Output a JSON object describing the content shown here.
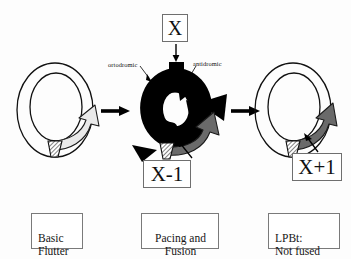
{
  "figure": {
    "type": "medical-mechanism-diagram",
    "background_color": "#fdfdfd"
  },
  "value_boxes": [
    {
      "id": "x",
      "label": "X",
      "meaning": "pacing stimulus cycle length"
    },
    {
      "id": "x-1",
      "label": "X-1",
      "meaning": "fused beat interval"
    },
    {
      "id": "x+1",
      "label": "X+1",
      "meaning": "last paced beat interval"
    }
  ],
  "captions": [
    {
      "id": "basic-flutter",
      "text": "Basic\nFlutter"
    },
    {
      "id": "pacing-fusion",
      "text": "Pacing and\nFusion"
    },
    {
      "id": "lpbt-not-fused",
      "text": "LPBt:\nNot fused"
    }
  ],
  "annotations": [
    {
      "id": "ortodromic",
      "text": "ortodromic"
    },
    {
      "id": "antidromic",
      "text": "antidromic"
    }
  ],
  "panels": [
    {
      "id": "panel-1",
      "caption": "Basic\nFlutter",
      "ring": "open annulus, thin black outline",
      "wave_color": "#e8e8e8",
      "wave_description": "light grey curved reentrant wavefront arrow, clockwise, head at right",
      "has_hatched_isthmus": true
    },
    {
      "id": "panel-2",
      "caption": "Pacing and\nFusion",
      "ring": "thick black annulus with bidirectional arrowheads",
      "wave_color": "#000000",
      "secondary_wave_color": "#666666",
      "wave_description": "black ortodromic and antidromic wavefronts plus grey fusion wavefront",
      "has_hatched_isthmus": true,
      "stimulus": "X delivered through pacing electrode at top"
    },
    {
      "id": "panel-3",
      "caption": "LPBt:\nNot fused",
      "ring": "open annulus, thin black outline",
      "wave_color": "#666666",
      "wave_description": "dark grey curved wavefront arrow, clockwise, head at upper right",
      "has_hatched_isthmus": true
    }
  ],
  "flow_arrows": [
    {
      "id": "arrow-1-2",
      "from": "panel-1",
      "to": "panel-2",
      "direction": "right"
    },
    {
      "id": "arrow-2-3",
      "from": "panel-2",
      "to": "panel-3",
      "direction": "right"
    }
  ],
  "colors": {
    "outline": "#000000",
    "light_wave": "#e8e8e8",
    "dark_wave": "#666666",
    "black_wave": "#000000",
    "box_border": "#6f6f6f",
    "text": "#111111"
  }
}
